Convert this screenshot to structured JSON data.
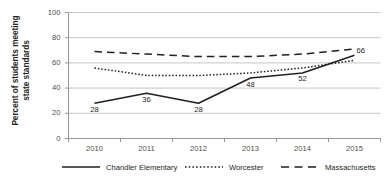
{
  "chart_data": {
    "type": "line",
    "title": "",
    "xlabel": "",
    "ylabel": "Percent of students meeting state standards",
    "ylim": [
      0,
      100
    ],
    "yticks": [
      "0",
      "20",
      "40",
      "60",
      "80",
      "100"
    ],
    "categories": [
      "2010",
      "2011",
      "2012",
      "2013",
      "2014",
      "2015"
    ],
    "grid": true,
    "legend_position": "bottom",
    "series": [
      {
        "name": "Chandler Elementary",
        "style": "solid",
        "color": "#231f20",
        "values": [
          28,
          36,
          28,
          48,
          52,
          66
        ],
        "data_labels": [
          "28",
          "36",
          "28",
          "48",
          "52",
          "66"
        ]
      },
      {
        "name": "Worcester",
        "style": "dotted",
        "color": "#231f20",
        "values": [
          56,
          50,
          50,
          52,
          56,
          62
        ],
        "data_labels": []
      },
      {
        "name": "Massachusetts",
        "style": "dashed",
        "color": "#231f20",
        "values": [
          69,
          67,
          65,
          65,
          67,
          71
        ],
        "data_labels": []
      }
    ]
  },
  "axis": {
    "ylabel_line1": "Percent of students meeting",
    "ylabel_line2": "state standards"
  },
  "legend": {
    "items": [
      {
        "label": "Chandler Elementary"
      },
      {
        "label": "Worcester"
      },
      {
        "label": "Massachusetts"
      }
    ]
  }
}
